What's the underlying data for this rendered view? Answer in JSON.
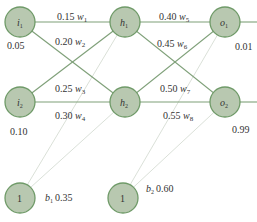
{
  "diagram": {
    "type": "neural-network",
    "nodes": {
      "i1": {
        "label": "i",
        "sub": "1",
        "value": "0.05"
      },
      "i2": {
        "label": "i",
        "sub": "2",
        "value": "0.10"
      },
      "h1": {
        "label": "h",
        "sub": "1"
      },
      "h2": {
        "label": "h",
        "sub": "2"
      },
      "o1": {
        "label": "o",
        "sub": "1",
        "value": "0.01"
      },
      "o2": {
        "label": "o",
        "sub": "2",
        "value": "0.99"
      },
      "b1": {
        "label": "1",
        "bias_name": "b",
        "bias_sub": "1",
        "bias_value": "0.35"
      },
      "b2": {
        "label": "1",
        "bias_name": "b",
        "bias_sub": "2",
        "bias_value": "0.60"
      }
    },
    "weights": {
      "w1": {
        "value": "0.15",
        "name": "w",
        "sub": "1",
        "from": "i1",
        "to": "h1"
      },
      "w2": {
        "value": "0.20",
        "name": "w",
        "sub": "2",
        "from": "i1",
        "to": "h2"
      },
      "w3": {
        "value": "0.25",
        "name": "w",
        "sub": "3",
        "from": "i2",
        "to": "h1"
      },
      "w4": {
        "value": "0.30",
        "name": "w",
        "sub": "4",
        "from": "i2",
        "to": "h2"
      },
      "w5": {
        "value": "0.40",
        "name": "w",
        "sub": "5",
        "from": "h1",
        "to": "o1"
      },
      "w6": {
        "value": "0.45",
        "name": "w",
        "sub": "6",
        "from": "h1",
        "to": "o2"
      },
      "w7": {
        "value": "0.50",
        "name": "w",
        "sub": "7",
        "from": "h2",
        "to": "o1"
      },
      "w8": {
        "value": "0.55",
        "name": "w",
        "sub": "8",
        "from": "h2",
        "to": "o2"
      }
    },
    "colors": {
      "node_fill": "#b8c8b0",
      "node_stroke": "#6f9a68",
      "edge": "#7fa079",
      "bias_edge": "#d6ddd4"
    }
  }
}
